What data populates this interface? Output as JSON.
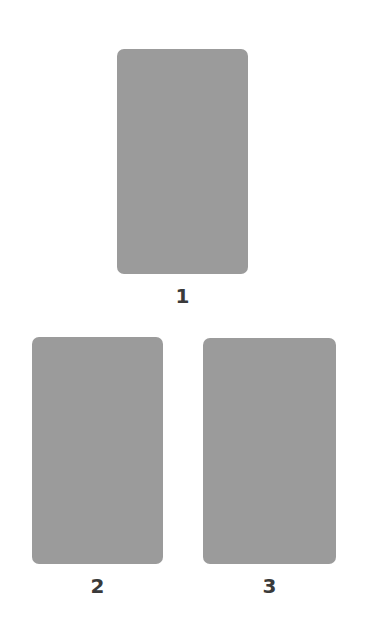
{
  "diagram": {
    "layout": "triangle",
    "card_color": "#9b9b9b",
    "label_color": "#3a3a3a",
    "background_color": "#ffffff",
    "slots": [
      {
        "position": "top-center",
        "label": "1"
      },
      {
        "position": "bottom-left",
        "label": "2"
      },
      {
        "position": "bottom-right",
        "label": "3"
      }
    ]
  }
}
